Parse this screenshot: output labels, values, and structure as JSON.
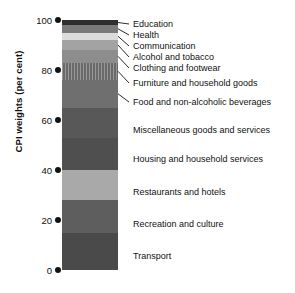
{
  "chart_data": {
    "type": "bar",
    "subtype": "stacked-bar-single",
    "title": "",
    "xlabel": "",
    "ylabel": "CPI weights (per cent)",
    "ylim": [
      0,
      100
    ],
    "yticks": [
      0,
      20,
      40,
      60,
      80,
      100
    ],
    "ytick_labels": [
      "0",
      "20",
      "40",
      "60",
      "80",
      "100"
    ],
    "grid": false,
    "legend": "none",
    "categories": [
      "CPI weights"
    ],
    "stack_order": "bottom-to-top",
    "series": [
      {
        "name": "Transport",
        "value": 15,
        "start": 0,
        "end": 15,
        "color": "#4a4a4a",
        "label_side": "inline",
        "texture": "solid"
      },
      {
        "name": "Recreation and culture",
        "value": 13,
        "start": 15,
        "end": 28,
        "color": "#5e5e5e",
        "label_side": "inline",
        "texture": "solid"
      },
      {
        "name": "Restaurants and hotels",
        "value": 12,
        "start": 28,
        "end": 40,
        "color": "#a9a9a9",
        "label_side": "inline",
        "texture": "solid"
      },
      {
        "name": "Housing and household services",
        "value": 13,
        "start": 40,
        "end": 53,
        "color": "#4f4f4f",
        "label_side": "inline",
        "texture": "solid"
      },
      {
        "name": "Miscellaneous goods and services",
        "value": 12,
        "start": 53,
        "end": 65,
        "color": "#585858",
        "label_side": "inline",
        "texture": "solid"
      },
      {
        "name": "Food and non-alcoholic beverages",
        "value": 11,
        "start": 65,
        "end": 76,
        "color": "#6f6f6f",
        "label_side": "leader",
        "texture": "solid"
      },
      {
        "name": "Furniture and household goods",
        "value": 7,
        "start": 76,
        "end": 83,
        "color": "#6a6a6a",
        "label_side": "leader",
        "texture": "hatched"
      },
      {
        "name": "Clothing and footwear",
        "value": 5,
        "start": 83,
        "end": 88,
        "color": "#8d8d8d",
        "label_side": "leader",
        "texture": "solid"
      },
      {
        "name": "Alcohol and tobacco",
        "value": 4,
        "start": 88,
        "end": 92,
        "color": "#a3a3a3",
        "label_side": "leader",
        "texture": "solid"
      },
      {
        "name": "Communication",
        "value": 3,
        "start": 92,
        "end": 95,
        "color": "#dcdcdc",
        "label_side": "leader",
        "texture": "solid"
      },
      {
        "name": "Health",
        "value": 3,
        "start": 95,
        "end": 98,
        "color": "#7a7a7a",
        "label_side": "leader",
        "texture": "solid"
      },
      {
        "name": "Education",
        "value": 2,
        "start": 98,
        "end": 100,
        "color": "#2e2e2e",
        "label_side": "leader",
        "texture": "solid"
      }
    ],
    "label_text_color": "#111111",
    "axis_color": "#111111"
  },
  "label_positions": {
    "Education": 24,
    "Health": 35,
    "Communication": 46,
    "Alcohol and tobacco": 57,
    "Clothing and footwear": 68,
    "Furniture and household goods": 83,
    "Food and non-alcoholic beverages": 102,
    "Miscellaneous goods and services": 130,
    "Housing and household services": 159,
    "Restaurants and hotels": 192,
    "Recreation and culture": 224,
    "Transport": 256
  }
}
